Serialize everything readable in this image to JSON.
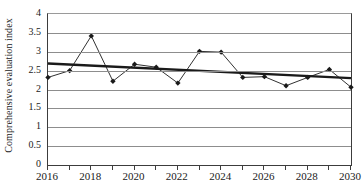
{
  "chart_data": {
    "type": "line",
    "title": "",
    "xlabel": "",
    "ylabel": "Comprehensive evaluation index",
    "x": [
      2016,
      2017,
      2018,
      2019,
      2020,
      2021,
      2022,
      2023,
      2024,
      2025,
      2026,
      2027,
      2028,
      2029,
      2030
    ],
    "xlim": [
      2016,
      2030
    ],
    "ylim": [
      0,
      4
    ],
    "yticks": [
      0,
      0.5,
      1,
      1.5,
      2,
      2.5,
      3,
      3.5,
      4
    ],
    "ytick_labels": [
      "0",
      "0.5",
      "1",
      "1.5",
      "2",
      "2.5",
      "3",
      "3.5",
      "4"
    ],
    "xticks": [
      2016,
      2017,
      2018,
      2019,
      2020,
      2021,
      2022,
      2023,
      2024,
      2025,
      2026,
      2027,
      2028,
      2029,
      2030
    ],
    "xtick_labels_shown": [
      "2016",
      "2018",
      "2020",
      "2022",
      "2024",
      "2026",
      "2028",
      "2030"
    ],
    "xtick_label_values": [
      2016,
      2018,
      2020,
      2022,
      2024,
      2026,
      2028,
      2030
    ],
    "grid": "horizontal",
    "legend": "none",
    "series": [
      {
        "name": "Comprehensive evaluation index",
        "kind": "line-with-markers",
        "marker": "diamond",
        "color": "#1a1a1a",
        "values": [
          2.32,
          2.5,
          3.42,
          2.22,
          2.67,
          2.59,
          2.17,
          3.01,
          2.99,
          2.32,
          2.34,
          2.1,
          2.32,
          2.53,
          2.06
        ]
      },
      {
        "name": "Linear trend line",
        "kind": "trend-line",
        "color": "#1a1a1a",
        "endpoints": [
          {
            "x": 2016,
            "y": 2.69
          },
          {
            "x": 2030,
            "y": 2.3
          }
        ]
      }
    ],
    "colors": {
      "series_line": "#1a1a1a",
      "trend_line": "#1a1a1a",
      "gridline": "#8d8d8d",
      "axis": "#3c3c3c",
      "background": "#ffffff",
      "text": "#1a1a1a"
    }
  }
}
